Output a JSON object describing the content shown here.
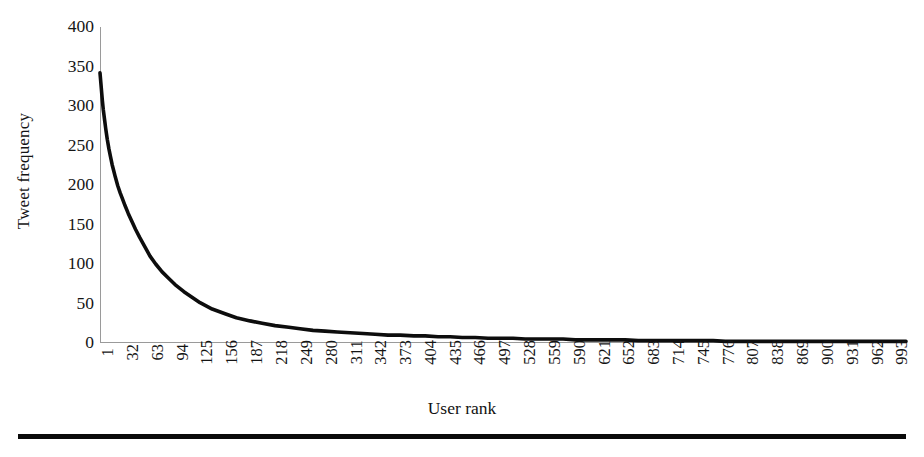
{
  "figure": {
    "caption_rule": "horizontal-rule"
  },
  "axes": {
    "y_title": "Tweet frequency",
    "x_title": "User rank",
    "y_ticks": [
      "0",
      "50",
      "100",
      "150",
      "200",
      "250",
      "300",
      "350",
      "400"
    ],
    "x_ticks": [
      "1",
      "32",
      "63",
      "94",
      "125",
      "156",
      "187",
      "218",
      "249",
      "280",
      "311",
      "342",
      "373",
      "404",
      "435",
      "466",
      "497",
      "528",
      "559",
      "590",
      "621",
      "652",
      "683",
      "714",
      "745",
      "776",
      "807",
      "838",
      "869",
      "900",
      "931",
      "962",
      "993"
    ]
  },
  "style": {
    "line_color": "#0d0d0d",
    "axis_color": "#9a9a9a",
    "background": "#ffffff",
    "line_width": 3.6
  },
  "chart_data": {
    "type": "line",
    "title": "",
    "subtitle": "",
    "xlabel": "User rank",
    "ylabel": "Tweet frequency",
    "xlim": [
      1,
      1000
    ],
    "ylim": [
      0,
      400
    ],
    "grid": false,
    "legend": null,
    "y_tick_values": [
      0,
      50,
      100,
      150,
      200,
      250,
      300,
      350,
      400
    ],
    "x_tick_values": [
      1,
      32,
      63,
      94,
      125,
      156,
      187,
      218,
      249,
      280,
      311,
      342,
      373,
      404,
      435,
      466,
      497,
      528,
      559,
      590,
      621,
      652,
      683,
      714,
      745,
      776,
      807,
      838,
      869,
      900,
      931,
      962,
      993
    ],
    "annotations": [],
    "series": [
      {
        "name": "Tweet frequency",
        "x": [
          1,
          2,
          3,
          4,
          5,
          6,
          7,
          8,
          9,
          10,
          12,
          14,
          16,
          18,
          20,
          23,
          26,
          29,
          32,
          36,
          40,
          45,
          50,
          56,
          63,
          70,
          78,
          86,
          94,
          105,
          115,
          125,
          140,
          156,
          170,
          187,
          202,
          218,
          235,
          249,
          265,
          280,
          295,
          311,
          327,
          342,
          358,
          373,
          390,
          404,
          420,
          435,
          450,
          466,
          482,
          497,
          513,
          528,
          544,
          559,
          575,
          590,
          606,
          621,
          637,
          652,
          668,
          683,
          699,
          714,
          730,
          745,
          761,
          776,
          792,
          807,
          823,
          838,
          854,
          869,
          885,
          900,
          916,
          931,
          947,
          962,
          978,
          993,
          1000
        ],
        "y": [
          342,
          330,
          318,
          306,
          296,
          288,
          280,
          272,
          265,
          258,
          246,
          236,
          226,
          218,
          210,
          199,
          190,
          182,
          174,
          164,
          155,
          144,
          134,
          123,
          110,
          100,
          90,
          82,
          74,
          65,
          58,
          51,
          43,
          37,
          32,
          28,
          25,
          22,
          20,
          18,
          16,
          15,
          14,
          13,
          12,
          11,
          10,
          10,
          9,
          9,
          8,
          8,
          7,
          7,
          6,
          6,
          6,
          5,
          5,
          5,
          5,
          4,
          4,
          4,
          4,
          4,
          3,
          3,
          3,
          3,
          3,
          3,
          3,
          2,
          2,
          2,
          2,
          2,
          2,
          2,
          2,
          2,
          2,
          2,
          2,
          2,
          2,
          2,
          2
        ]
      }
    ]
  }
}
